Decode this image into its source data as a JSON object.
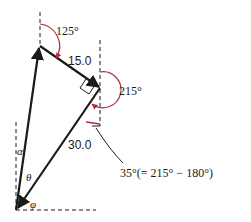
{
  "diagram": {
    "labels": {
      "angle_top": "125°",
      "magnitude_1": "15.0",
      "angle_right": "215°",
      "magnitude_2": "30.0",
      "angle_note": "35°(= 215° − 180°)",
      "alpha": "α",
      "theta": "θ",
      "phi": "φ"
    },
    "vectors": [
      {
        "name": "resultant",
        "label": "α side"
      },
      {
        "name": "vector-a",
        "magnitude": 15.0,
        "direction_deg": 125
      },
      {
        "name": "vector-b",
        "magnitude": 30.0,
        "direction_deg": 215
      }
    ],
    "colors": {
      "line": "#1a1a1a",
      "angle_arc": "#b0303a",
      "text": "#1a1a1a"
    }
  }
}
